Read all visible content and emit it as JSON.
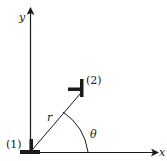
{
  "diagram": {
    "axes": {
      "x_label": "x",
      "y_label": "y"
    },
    "labels": {
      "dislocation_1": "(1)",
      "dislocation_2": "(2)",
      "distance": "r",
      "angle": "θ"
    },
    "colors": {
      "ink": "#1a1a1a",
      "background": "#ffffff"
    }
  }
}
